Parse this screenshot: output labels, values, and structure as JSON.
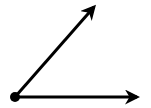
{
  "diagram": {
    "type": "angle",
    "vertex": {
      "label": ""
    },
    "rays": [
      {
        "name": "upper-ray",
        "direction_deg": 48.6,
        "label": ""
      },
      {
        "name": "horizontal-ray",
        "direction_deg": 0,
        "label": ""
      }
    ],
    "colors": {
      "stroke": "#000000",
      "background": "#ffffff"
    }
  }
}
